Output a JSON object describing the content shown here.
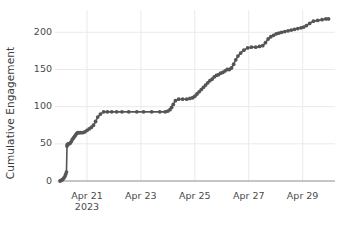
{
  "chart_data": {
    "type": "line",
    "title": "",
    "subtitle": "",
    "xlabel": "",
    "ylabel": "Cumulative Engagement",
    "grid": true,
    "legend": null,
    "marker": "circle",
    "line_color": "#555555",
    "marker_color": "#555555",
    "axis_color": "#888888",
    "grid_color": "#eaeaea",
    "text_color": "#4a4a4a",
    "ylim": [
      0,
      230
    ],
    "yticks": [
      0,
      50,
      100,
      150,
      200
    ],
    "ytick_labels": [
      "0",
      "50",
      "100",
      "150",
      "200"
    ],
    "xlim": [
      "Apr 20",
      "Apr 30"
    ],
    "xticks": [
      "Apr 21",
      "Apr 23",
      "Apr 25",
      "Apr 27",
      "Apr 29"
    ],
    "xtick_labels": [
      "Apr 21",
      "Apr 23",
      "Apr 25",
      "Apr 27",
      "Apr 29"
    ],
    "xtick_sublabel": "2023",
    "xtick_sublabel_index": 0,
    "x_unit": "day",
    "x_numeric_ticks": [
      21,
      23,
      25,
      27,
      29
    ],
    "x": [
      20.0,
      20.05,
      20.1,
      20.14,
      20.18,
      20.21,
      20.24,
      20.26,
      20.27,
      20.3,
      20.34,
      20.38,
      20.42,
      20.46,
      20.5,
      20.54,
      20.58,
      20.62,
      20.66,
      20.7,
      20.76,
      20.84,
      20.92,
      21.0,
      21.08,
      21.16,
      21.24,
      21.32,
      21.4,
      21.5,
      21.62,
      21.76,
      21.92,
      22.1,
      22.3,
      22.55,
      22.85,
      23.1,
      23.4,
      23.7,
      23.9,
      24.0,
      24.08,
      24.14,
      24.2,
      24.28,
      24.4,
      24.55,
      24.7,
      24.82,
      24.92,
      25.0,
      25.08,
      25.16,
      25.24,
      25.32,
      25.4,
      25.48,
      25.56,
      25.64,
      25.72,
      25.8,
      25.88,
      25.96,
      26.04,
      26.12,
      26.2,
      26.28,
      26.36,
      26.44,
      26.52,
      26.6,
      26.7,
      26.82,
      26.96,
      27.1,
      27.26,
      27.4,
      27.52,
      27.62,
      27.72,
      27.82,
      27.92,
      28.02,
      28.12,
      28.22,
      28.34,
      28.46,
      28.58,
      28.7,
      28.82,
      28.94,
      29.04,
      29.14,
      29.26,
      29.4,
      29.56,
      29.72,
      29.86,
      29.96
    ],
    "y": [
      0,
      1,
      2,
      4,
      6,
      9,
      12,
      47,
      49,
      50,
      50,
      51,
      53,
      56,
      58,
      60,
      62,
      64,
      65,
      65,
      65,
      65,
      66,
      68,
      70,
      72,
      75,
      80,
      86,
      90,
      93,
      93,
      93,
      93,
      93,
      93,
      93,
      93,
      93,
      93,
      93,
      94,
      96,
      99,
      103,
      108,
      110,
      110,
      110,
      111,
      112,
      114,
      117,
      120,
      123,
      126,
      129,
      132,
      135,
      137,
      140,
      142,
      143,
      145,
      146,
      148,
      150,
      150,
      152,
      157,
      163,
      168,
      172,
      176,
      179,
      180,
      180,
      181,
      182,
      186,
      191,
      194,
      196,
      198,
      199,
      200,
      201,
      202,
      203,
      204,
      205,
      206,
      207,
      209,
      212,
      215,
      216,
      217,
      218,
      218
    ],
    "final_value": 218,
    "plateau_value": 93,
    "data_point_count": 100
  },
  "layout": {
    "plot_left": 60,
    "plot_right": 335,
    "plot_top": 10,
    "plot_bottom": 181
  }
}
